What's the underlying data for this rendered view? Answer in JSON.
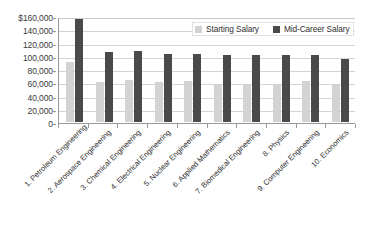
{
  "chart_data": {
    "type": "bar",
    "title": "",
    "subtitle": "",
    "xlabel": "",
    "ylabel": "",
    "ylim": [
      0,
      160000
    ],
    "ytick_values": [
      0,
      20000,
      40000,
      60000,
      80000,
      100000,
      120000,
      140000,
      160000
    ],
    "ytick_labels": [
      "0",
      "20,000",
      "40,000",
      "60,000",
      "80,000",
      "100,000",
      "120,000",
      "140,000",
      "$160,000"
    ],
    "grid": "horizontal",
    "legend_position": "top-right-inside",
    "categories": [
      "1. Petroleum Engineering",
      "2. Aerospace Engineering",
      "3. Chemical Engineering",
      "4. Electrical Engineering",
      "5. Nuclear Engineering",
      "6. Applied Mathematics",
      "7. Biomedical Engineering",
      "8. Physics",
      "9. Computer Engineering",
      "10. Economics"
    ],
    "series": [
      {
        "name": "Starting Salary",
        "color": "#d3d3d3",
        "values": [
          90000,
          60000,
          63000,
          60000,
          62000,
          58000,
          58000,
          57000,
          62000,
          56000
        ]
      },
      {
        "name": "Mid-Career Salary",
        "color": "#4a4a4a",
        "values": [
          155000,
          105000,
          107000,
          103000,
          103000,
          101000,
          101000,
          101000,
          101000,
          95000
        ]
      }
    ]
  }
}
